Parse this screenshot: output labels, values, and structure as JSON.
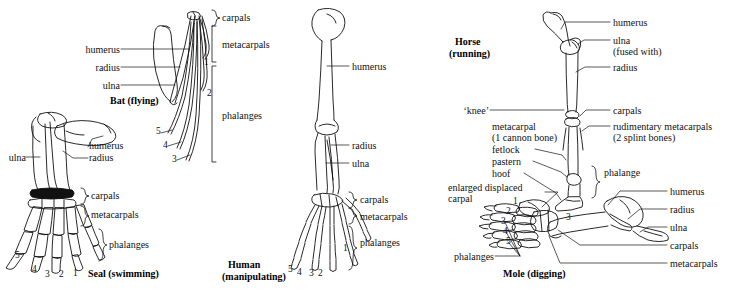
{
  "figure": {
    "ink_color": "#111111",
    "background": "#ffffff"
  },
  "panels": {
    "bat": {
      "caption": "Bat (flying)",
      "labels": {
        "humerus": "humerus",
        "radius": "radius",
        "ulna": "ulna"
      },
      "braces": {
        "carpals": "carpals",
        "metacarpals": "metacarpals",
        "phalanges": "phalanges"
      },
      "digits": [
        "1",
        "2",
        "3",
        "4",
        "5"
      ]
    },
    "seal": {
      "caption": "Seal (swimming)",
      "labels": {
        "ulna": "ulna",
        "humerus": "humerus",
        "radius": "radius"
      },
      "braces": {
        "carpals": "carpals",
        "metacarpals": "metacarpals",
        "phalanges": "phalanges"
      },
      "digits": [
        "1",
        "2",
        "3",
        "4",
        "5"
      ]
    },
    "human": {
      "caption_line1": "Human",
      "caption_line2": "(manipulating)",
      "labels": {
        "humerus": "humerus",
        "radius": "radius",
        "ulna": "ulna"
      },
      "braces": {
        "carpals": "carpals",
        "metacarpals": "metacarpals",
        "phalanges": "phalanges"
      },
      "digits": [
        "1",
        "2",
        "3",
        "4",
        "5"
      ]
    },
    "horse": {
      "caption_line1": "Horse",
      "caption_line2": "(running)",
      "labels_right": {
        "humerus": "humerus",
        "ulna": "ulna",
        "ulna_note": "(fused with)",
        "radius": "radius",
        "carpals": "carpals",
        "rudimentary": "rudimentary metacarpals",
        "rudimentary_note": "(2 splint bones)"
      },
      "labels_left": {
        "knee": "‘knee’",
        "metacarpal": "metacarpal",
        "metacarpal_note": "(1 cannon bone)",
        "fetlock": "fetlock",
        "pastern": "pastern",
        "hoof": "hoof"
      },
      "brace": {
        "phalange": "phalange"
      },
      "digits": [
        "3"
      ]
    },
    "mole": {
      "caption": "Mole (digging)",
      "labels_left": {
        "enlarged_line1": "enlarged displaced",
        "enlarged_line2": "carpal",
        "phalanges": "phalanges"
      },
      "labels_right": {
        "humerus": "humerus",
        "radius": "radius",
        "ulna": "ulna",
        "carpals": "carpals",
        "metacarpals": "metacarpals"
      },
      "digits": [
        "1",
        "2",
        "3",
        "4",
        "5"
      ]
    }
  }
}
